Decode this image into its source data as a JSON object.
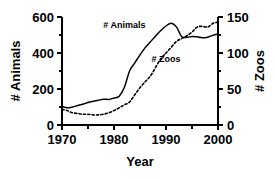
{
  "chart_data": {
    "type": "line",
    "title": "",
    "xlabel": "Year",
    "ylabel": "# Animals",
    "y2label": "# Zoos",
    "xlim": [
      1970,
      2000
    ],
    "ylim": [
      0,
      600
    ],
    "y2lim": [
      0,
      150
    ],
    "grid": false,
    "legend": "in-plot annotations",
    "xticks": [
      1970,
      1975,
      1980,
      1985,
      1990,
      1995,
      2000
    ],
    "xtick_labels": [
      "1970",
      "",
      "1980",
      "",
      "1990",
      "",
      "2000"
    ],
    "yticks": [
      0,
      200,
      400,
      600
    ],
    "ytick_labels": [
      "0",
      "200",
      "400",
      "600"
    ],
    "y2ticks": [
      0,
      50,
      100,
      150
    ],
    "y2tick_labels": [
      "0",
      "50",
      "100",
      "150"
    ],
    "x": [
      1970,
      1971,
      1972,
      1973,
      1974,
      1975,
      1976,
      1977,
      1978,
      1979,
      1980,
      1981,
      1982,
      1983,
      1984,
      1985,
      1986,
      1987,
      1988,
      1989,
      1990,
      1991,
      1992,
      1993,
      1994,
      1995,
      1996,
      1997,
      1998,
      1999,
      2000
    ],
    "series": [
      {
        "name": "# Animals",
        "axis": "left",
        "style": "solid",
        "label_x": 1982,
        "label_y": 540,
        "values": [
          103,
          96,
          100,
          108,
          115,
          125,
          132,
          138,
          143,
          142,
          150,
          160,
          210,
          300,
          345,
          390,
          430,
          462,
          495,
          525,
          550,
          565,
          545,
          492,
          487,
          492,
          490,
          485,
          488,
          498,
          505
        ]
      },
      {
        "name": "# Zoos",
        "axis": "right",
        "style": "dashed",
        "label_x": 1990,
        "label_y": 88,
        "values": [
          22,
          20,
          17,
          16,
          15,
          15,
          14,
          14,
          15,
          17,
          20,
          24,
          28,
          32,
          42,
          52,
          60,
          68,
          80,
          92,
          100,
          108,
          116,
          120,
          124,
          129,
          136,
          137,
          136,
          141,
          143
        ]
      }
    ]
  },
  "axis_labels": {
    "left_title": "# Animals",
    "right_title": "# Zoos",
    "x_title": "Year"
  },
  "annotations": {
    "animals": "# Animals",
    "zoos": "# Zoos"
  },
  "colors": {
    "foreground": "#000000",
    "background": "#ffffff"
  }
}
